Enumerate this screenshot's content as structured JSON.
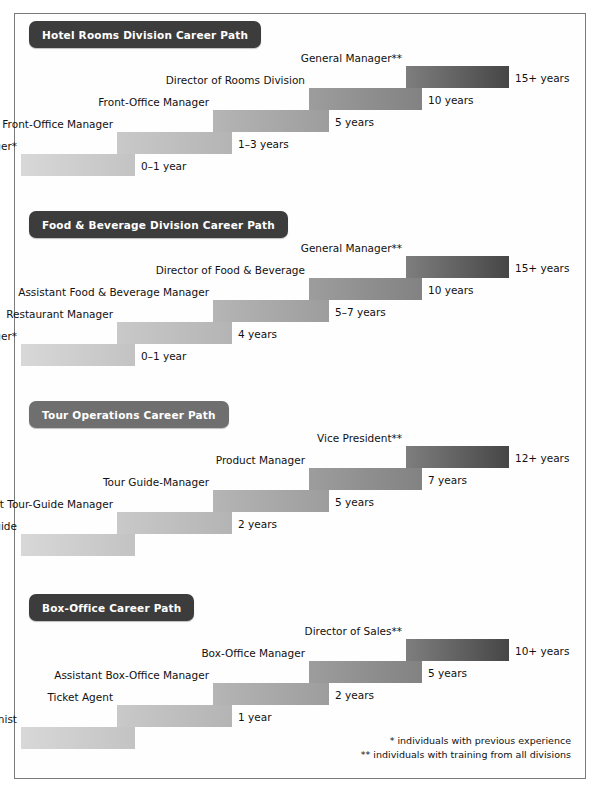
{
  "document": {
    "title": "Hospitality Career Path Diagrams",
    "footnotes": [
      "*  individuals with previous experience",
      "** individuals with training from all divisions"
    ]
  },
  "palette": {
    "badge_dark": "#3c3c3c",
    "badge_light": "#6f6f6f",
    "step_1_start": "#d8d8d8",
    "step_1_end": "#c3c3c3",
    "step_2_start": "#c9c9c9",
    "step_2_end": "#b4b4b4",
    "step_3_start": "#b5b5b5",
    "step_3_end": "#9d9d9d",
    "step_4_start": "#9d9d9d",
    "step_4_end": "#828282",
    "step_5_start": "#7e7e7e",
    "step_5_end": "#464646",
    "border": "#7a7a7a",
    "text": "#111111"
  },
  "chart_data": [
    {
      "type": "bar",
      "title": "Hotel Rooms Division Career Path",
      "badge_style": "dark",
      "xlabel": "",
      "ylabel": "Career level",
      "categories": [
        "Front Desk Manager*",
        "Assistant Front-Office Manager",
        "Front-Office Manager",
        "Director of Rooms Division",
        "General Manager**"
      ],
      "values": [
        "0–1 year",
        "1–3 years",
        "5 years",
        "10 years",
        "15+ years"
      ],
      "steps": [
        {
          "role": "Front Desk Manager*",
          "years": "0–1 year"
        },
        {
          "role": "Assistant Front-Office Manager",
          "years": "1–3 years"
        },
        {
          "role": "Front-Office Manager",
          "years": "5 years"
        },
        {
          "role": "Director of Rooms Division",
          "years": "10 years"
        },
        {
          "role": "General Manager**",
          "years": "15+ years"
        }
      ]
    },
    {
      "type": "bar",
      "title": "Food & Beverage Division Career Path",
      "badge_style": "dark",
      "xlabel": "",
      "ylabel": "Career level",
      "categories": [
        "Assistant Manager*",
        "Restaurant Manager",
        "Assistant Food & Beverage Manager",
        "Director of Food & Beverage",
        "General Manager**"
      ],
      "values": [
        "0–1 year",
        "4 years",
        "5–7 years",
        "10 years",
        "15+ years"
      ],
      "steps": [
        {
          "role": "Assistant Manager*",
          "years": "0–1 year"
        },
        {
          "role": "Restaurant Manager",
          "years": "4 years"
        },
        {
          "role": "Assistant Food & Beverage Manager",
          "years": "5–7 years"
        },
        {
          "role": "Director of Food & Beverage",
          "years": "10 years"
        },
        {
          "role": "General Manager**",
          "years": "15+ years"
        }
      ]
    },
    {
      "type": "bar",
      "title": "Tour Operations Career Path",
      "badge_style": "light",
      "xlabel": "",
      "ylabel": "Career level",
      "categories": [
        "Tour Guide",
        "Assistant Tour-Guide Manager",
        "Tour Guide-Manager",
        "Product Manager",
        "Vice President**"
      ],
      "values": [
        "",
        "2 years",
        "5 years",
        "7 years",
        "12+ years"
      ],
      "steps": [
        {
          "role": "Tour Guide",
          "years": ""
        },
        {
          "role": "Assistant Tour-Guide Manager",
          "years": "2 years"
        },
        {
          "role": "Tour Guide-Manager",
          "years": "5 years"
        },
        {
          "role": "Product Manager",
          "years": "7 years"
        },
        {
          "role": "Vice President**",
          "years": "12+ years"
        }
      ]
    },
    {
      "type": "bar",
      "title": "Box-Office Career Path",
      "badge_style": "dark",
      "xlabel": "",
      "ylabel": "Career level",
      "categories": [
        "Reservationist",
        "Ticket Agent",
        "Assistant Box-Office Manager",
        "Box-Office Manager",
        "Director of Sales**"
      ],
      "values": [
        "",
        "1 year",
        "2 years",
        "5 years",
        "10+ years"
      ],
      "steps": [
        {
          "role": "Reservationist",
          "years": ""
        },
        {
          "role": "Ticket Agent",
          "years": "1 year"
        },
        {
          "role": "Assistant Box-Office Manager",
          "years": "2 years"
        },
        {
          "role": "Box-Office Manager",
          "years": "5 years"
        },
        {
          "role": "Director of Sales**",
          "years": "10+ years"
        }
      ]
    }
  ]
}
